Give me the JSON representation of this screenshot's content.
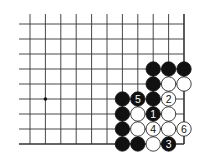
{
  "diagram": {
    "type": "go-board-corner",
    "grid": {
      "cols": 11,
      "rows": 9,
      "x0": 30,
      "y0": 24,
      "dx": 15.4,
      "dy": 15,
      "open_left": true,
      "open_top": true
    },
    "star_points": [
      {
        "col": 1,
        "row": 5
      }
    ],
    "stones": [
      {
        "col": 8,
        "row": 3,
        "color": "black",
        "label": ""
      },
      {
        "col": 9,
        "row": 3,
        "color": "black",
        "label": ""
      },
      {
        "col": 10,
        "row": 3,
        "color": "black",
        "label": ""
      },
      {
        "col": 8,
        "row": 4,
        "color": "black",
        "label": ""
      },
      {
        "col": 9,
        "row": 4,
        "color": "white",
        "label": ""
      },
      {
        "col": 10,
        "row": 4,
        "color": "white",
        "label": ""
      },
      {
        "col": 6,
        "row": 5,
        "color": "black",
        "label": ""
      },
      {
        "col": 7,
        "row": 5,
        "color": "black",
        "label": "5"
      },
      {
        "col": 8,
        "row": 5,
        "color": "black",
        "label": ""
      },
      {
        "col": 9,
        "row": 5,
        "color": "white",
        "label": "2"
      },
      {
        "col": 6,
        "row": 6,
        "color": "black",
        "label": ""
      },
      {
        "col": 7,
        "row": 6,
        "color": "white",
        "label": ""
      },
      {
        "col": 8,
        "row": 6,
        "color": "black",
        "label": "1"
      },
      {
        "col": 9,
        "row": 6,
        "color": "white",
        "label": ""
      },
      {
        "col": 6,
        "row": 7,
        "color": "black",
        "label": ""
      },
      {
        "col": 7,
        "row": 7,
        "color": "white",
        "label": ""
      },
      {
        "col": 8,
        "row": 7,
        "color": "white",
        "label": "4"
      },
      {
        "col": 9,
        "row": 7,
        "color": "white",
        "label": ""
      },
      {
        "col": 10,
        "row": 7,
        "color": "white",
        "label": "6"
      },
      {
        "col": 6,
        "row": 8,
        "color": "black",
        "label": ""
      },
      {
        "col": 7,
        "row": 8,
        "color": "black",
        "label": ""
      },
      {
        "col": 8,
        "row": 8,
        "color": "white",
        "label": ""
      },
      {
        "col": 9,
        "row": 8,
        "color": "black",
        "label": "3"
      }
    ]
  }
}
